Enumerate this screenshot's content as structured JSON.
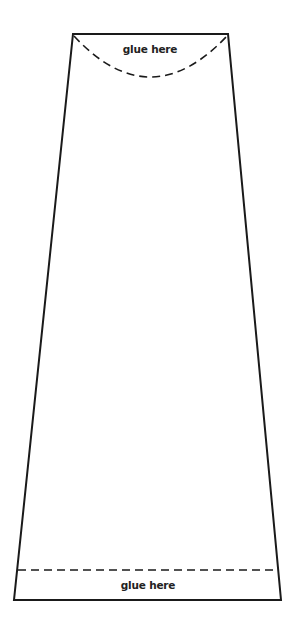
{
  "diagram": {
    "type": "paper-cutout-template",
    "shape": "trapezoid",
    "stroke_color": "#1a1a1a",
    "background": "#ffffff",
    "outline": {
      "top_left": [
        73,
        34
      ],
      "top_right": [
        228,
        34
      ],
      "bottom_right": [
        281,
        600
      ],
      "bottom_left": [
        14,
        600
      ]
    },
    "top_tab": {
      "label": "glue here",
      "fold_line": "dashed-arc"
    },
    "bottom_tab": {
      "label": "glue here",
      "fold_line": "dashed-straight"
    }
  }
}
